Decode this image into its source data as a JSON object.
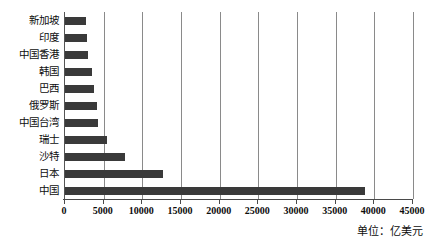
{
  "chart_data": {
    "type": "bar",
    "orientation": "horizontal",
    "title": "",
    "subtitle": "",
    "xlabel": "",
    "ylabel": "",
    "categories": [
      "新加坡",
      "印度",
      "中国香港",
      "韩国",
      "巴西",
      "俄罗斯",
      "中国台湾",
      "瑞士",
      "沙特",
      "日本",
      "中国"
    ],
    "values": [
      2700,
      2850,
      2950,
      3500,
      3700,
      4100,
      4250,
      5400,
      7750,
      12700,
      38800
    ],
    "series": [
      {
        "name": "",
        "values": [
          2700,
          2850,
          2950,
          3500,
          3700,
          4100,
          4250,
          5400,
          7750,
          12700,
          38800
        ]
      }
    ],
    "xlim": [
      0,
      45000
    ],
    "xticks": [
      0,
      5000,
      10000,
      15000,
      20000,
      25000,
      30000,
      35000,
      40000,
      45000
    ],
    "xtick_labels": [
      "0",
      "5000",
      "10000",
      "15000",
      "20000",
      "25000",
      "30000",
      "35000",
      "40000",
      "45000"
    ],
    "grid": "vertical",
    "legend": "none",
    "annotations": [
      "单位：亿美元"
    ],
    "bar_color": "#3a3a3a",
    "grid_color": "#8a8a8a",
    "axis_color": "#4a4a4a"
  },
  "annotation": {
    "unit_note": "单位：亿美元"
  }
}
